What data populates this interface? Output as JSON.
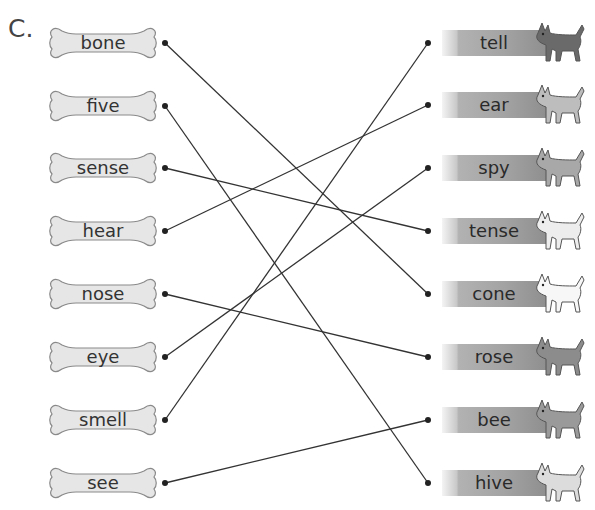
{
  "section": {
    "label": "C.",
    "header_cut_text": "a / b c / d b e"
  },
  "left_words": [
    {
      "label": "bone",
      "y": 43
    },
    {
      "label": "five",
      "y": 106
    },
    {
      "label": "sense",
      "y": 168
    },
    {
      "label": "hear",
      "y": 231
    },
    {
      "label": "nose",
      "y": 294
    },
    {
      "label": "eye",
      "y": 357
    },
    {
      "label": "smell",
      "y": 420
    },
    {
      "label": "see",
      "y": 483
    }
  ],
  "right_words": [
    {
      "label": "tell",
      "y": 43,
      "dog": "dark-shepherd"
    },
    {
      "label": "ear",
      "y": 105,
      "dog": "puppy"
    },
    {
      "label": "spy",
      "y": 168,
      "dog": "terrier"
    },
    {
      "label": "tense",
      "y": 231,
      "dog": "white-puppy"
    },
    {
      "label": "cone",
      "y": 294,
      "dog": "fluffy-white"
    },
    {
      "label": "rose",
      "y": 357,
      "dog": "dachshund"
    },
    {
      "label": "bee",
      "y": 420,
      "dog": "tall-dog"
    },
    {
      "label": "hive",
      "y": 483,
      "dog": "bulldog"
    }
  ],
  "matches": [
    {
      "from": "bone",
      "to": "cone"
    },
    {
      "from": "five",
      "to": "hive"
    },
    {
      "from": "sense",
      "to": "tense"
    },
    {
      "from": "hear",
      "to": "ear"
    },
    {
      "from": "nose",
      "to": "rose"
    },
    {
      "from": "eye",
      "to": "spy"
    },
    {
      "from": "smell",
      "to": "tell"
    },
    {
      "from": "see",
      "to": "bee"
    }
  ],
  "colors": {
    "line": "#333333",
    "bone_fill": "#e6e6e6",
    "bone_stroke": "#8a8a8a",
    "dot": "#222222"
  }
}
